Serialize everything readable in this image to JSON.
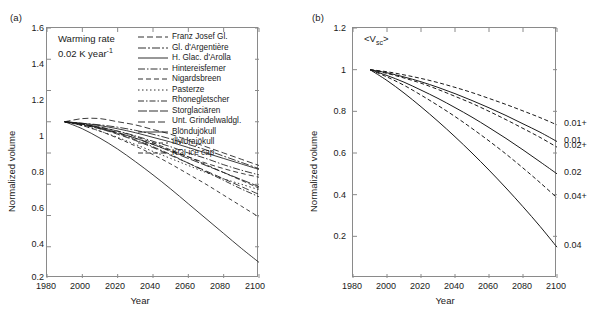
{
  "figure": {
    "width": 599,
    "height": 330,
    "background": "#ffffff",
    "line_color": "#1a1a1a",
    "axis_color": "#8a8a8a"
  },
  "panels": [
    {
      "id": "a",
      "label": "(a)",
      "annotation_line1": "Warming rate",
      "annotation_line2_pre": "0.02 K year",
      "annotation_line2_sup": "-1",
      "chart_data": {
        "type": "line",
        "title": "",
        "xlabel": "Year",
        "ylabel": "Normalized volume",
        "xlim": [
          1980,
          2100
        ],
        "ylim": [
          0.0,
          1.6
        ],
        "xticks": [
          1980,
          2000,
          2020,
          2040,
          2060,
          2080,
          2100
        ],
        "yticks": [
          0.2,
          0.4,
          0.6,
          0.8,
          1.0,
          1.2,
          1.4,
          1.6
        ],
        "grid": false,
        "legend_position": "top-right",
        "x": [
          1990,
          2000,
          2010,
          2020,
          2030,
          2040,
          2050,
          2060,
          2070,
          2080,
          2090,
          2100
        ],
        "series": [
          {
            "name": "Franz Josef Gl.",
            "dash": "6,3",
            "values": [
              1.0,
              1.02,
              1.02,
              1.0,
              0.98,
              0.95,
              0.92,
              0.88,
              0.84,
              0.8,
              0.76,
              0.72
            ]
          },
          {
            "name": "Gl. d'Argentière",
            "dash": "8,2,2,2",
            "values": [
              1.0,
              0.99,
              0.98,
              0.965,
              0.945,
              0.92,
              0.89,
              0.855,
              0.82,
              0.78,
              0.74,
              0.7
            ]
          },
          {
            "name": "H. Glac. d'Arolla",
            "dash": "none",
            "values": [
              1.0,
              0.99,
              0.975,
              0.955,
              0.93,
              0.9,
              0.87,
              0.835,
              0.8,
              0.765,
              0.73,
              0.695
            ]
          },
          {
            "name": "Hintereisferner",
            "dash": "7,2,1.5,2",
            "values": [
              1.0,
              0.985,
              0.965,
              0.94,
              0.91,
              0.875,
              0.84,
              0.8,
              0.765,
              0.725,
              0.69,
              0.66
            ]
          },
          {
            "name": "Nigardsbreen",
            "dash": "5,3",
            "values": [
              1.0,
              0.985,
              0.96,
              0.93,
              0.895,
              0.855,
              0.815,
              0.775,
              0.735,
              0.7,
              0.67,
              0.645
            ]
          },
          {
            "name": "Pasterze",
            "dash": "1.5,2.5",
            "values": [
              1.0,
              0.975,
              0.94,
              0.9,
              0.855,
              0.81,
              0.765,
              0.72,
              0.675,
              0.635,
              0.6,
              0.565
            ]
          },
          {
            "name": "Rhonegletscher",
            "dash": "6,2,1.5,2",
            "values": [
              1.0,
              0.98,
              0.955,
              0.925,
              0.885,
              0.84,
              0.79,
              0.735,
              0.68,
              0.625,
              0.57,
              0.52
            ]
          },
          {
            "name": "Storglaciären",
            "dash": "9,2",
            "values": [
              1.0,
              0.985,
              0.96,
              0.93,
              0.895,
              0.855,
              0.81,
              0.765,
              0.72,
              0.675,
              0.63,
              0.585
            ]
          },
          {
            "name": "Unt. Grindelwaldgl.",
            "dash": "7,3",
            "values": [
              1.0,
              0.98,
              0.955,
              0.92,
              0.88,
              0.835,
              0.785,
              0.735,
              0.685,
              0.635,
              0.585,
              0.535
            ]
          },
          {
            "name": "Blöndujökull",
            "dash": "none",
            "values": [
              1.0,
              0.955,
              0.895,
              0.825,
              0.745,
              0.66,
              0.57,
              0.475,
              0.38,
              0.285,
              0.19,
              0.1
            ]
          },
          {
            "name": "Illvidrajökull",
            "dash": "4,3",
            "values": [
              1.0,
              0.975,
              0.94,
              0.895,
              0.845,
              0.79,
              0.73,
              0.665,
              0.6,
              0.53,
              0.46,
              0.39
            ]
          },
          {
            "name": "KGI ice cap",
            "dash": "5,2.5",
            "values": [
              1.0,
              0.985,
              0.965,
              0.94,
              0.905,
              0.865,
              0.82,
              0.775,
              0.725,
              0.675,
              0.625,
              0.575
            ]
          }
        ]
      }
    },
    {
      "id": "b",
      "label": "(b)",
      "annotation_pre": "<V",
      "annotation_sub": "sc",
      "annotation_post": ">",
      "chart_data": {
        "type": "line",
        "title": "",
        "xlabel": "Year",
        "ylabel": "Normalized volume",
        "xlim": [
          1980,
          2100
        ],
        "ylim": [
          0.0,
          1.2
        ],
        "xticks": [
          1980,
          2000,
          2020,
          2040,
          2060,
          2080,
          2100
        ],
        "yticks": [
          0.2,
          0.4,
          0.6,
          0.8,
          1.0,
          1.2
        ],
        "grid": false,
        "legend_position": "right-inline-labels",
        "x": [
          1990,
          2000,
          2010,
          2020,
          2030,
          2040,
          2050,
          2060,
          2070,
          2080,
          2090,
          2100
        ],
        "series": [
          {
            "name": "0.01+",
            "label": "0.01+",
            "dash": "4,2.5",
            "values": [
              1.0,
              0.99,
              0.975,
              0.958,
              0.938,
              0.915,
              0.89,
              0.862,
              0.833,
              0.802,
              0.77,
              0.735
            ]
          },
          {
            "name": "0.01",
            "label": "0.01",
            "dash": "none",
            "values": [
              1.0,
              0.985,
              0.965,
              0.942,
              0.915,
              0.885,
              0.852,
              0.817,
              0.78,
              0.74,
              0.7,
              0.655
            ]
          },
          {
            "name": "0.02+",
            "label": "0.02+",
            "dash": "4,2.5",
            "values": [
              1.0,
              0.982,
              0.96,
              0.935,
              0.905,
              0.872,
              0.838,
              0.8,
              0.76,
              0.718,
              0.675,
              0.628
            ]
          },
          {
            "name": "0.02",
            "label": "0.02",
            "dash": "none",
            "values": [
              1.0,
              0.972,
              0.94,
              0.902,
              0.862,
              0.818,
              0.772,
              0.722,
              0.67,
              0.615,
              0.558,
              0.5
            ]
          },
          {
            "name": "0.04+",
            "label": "0.04+",
            "dash": "4,2.5",
            "values": [
              1.0,
              0.965,
              0.925,
              0.878,
              0.828,
              0.775,
              0.718,
              0.658,
              0.595,
              0.528,
              0.458,
              0.385
            ]
          },
          {
            "name": "0.04",
            "label": "0.04",
            "dash": "none",
            "values": [
              1.0,
              0.948,
              0.888,
              0.822,
              0.752,
              0.678,
              0.6,
              0.518,
              0.432,
              0.342,
              0.248,
              0.148
            ]
          }
        ]
      }
    }
  ]
}
